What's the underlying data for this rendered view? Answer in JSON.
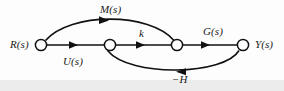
{
  "figure": {
    "type": "signal-flow-graph",
    "title": "",
    "background_color": "#fdfdfd",
    "stroke_color": "#111111",
    "node_fill": "#ffffff",
    "nodes": [
      {
        "id": "r",
        "label": "R(s)",
        "label_side": "left",
        "cx": 41,
        "cy": 45,
        "r": 6
      },
      {
        "id": "u",
        "label": "",
        "label_side": "none",
        "cx": 110,
        "cy": 45,
        "r": 6
      },
      {
        "id": "m",
        "label": "",
        "label_side": "none",
        "cx": 177,
        "cy": 45,
        "r": 6
      },
      {
        "id": "y",
        "label": "Y(s)",
        "label_side": "right",
        "cx": 243,
        "cy": 45,
        "r": 6
      }
    ],
    "edges": [
      {
        "id": "r-to-u",
        "from": "r",
        "to": "u",
        "label": "U(s)",
        "label_position": "below",
        "shape": "straight"
      },
      {
        "id": "u-to-m",
        "from": "u",
        "to": "m",
        "label": "k",
        "label_position": "above",
        "shape": "straight"
      },
      {
        "id": "m-to-y",
        "from": "m",
        "to": "y",
        "label": "G(s)",
        "label_position": "above",
        "shape": "straight"
      },
      {
        "id": "r-to-m",
        "from": "r",
        "to": "m",
        "label": "M(s)",
        "label_position": "above",
        "shape": "curved-up"
      },
      {
        "id": "y-to-u",
        "from": "y",
        "to": "u",
        "label": "−H",
        "label_position": "below",
        "shape": "curved-down"
      }
    ],
    "labels": {
      "input": "R(s)",
      "output": "Y(s)",
      "forward_u": "U(s)",
      "gain_k": "k",
      "plant_g": "G(s)",
      "feedforward_m": "M(s)",
      "feedback_h": "−H"
    }
  }
}
